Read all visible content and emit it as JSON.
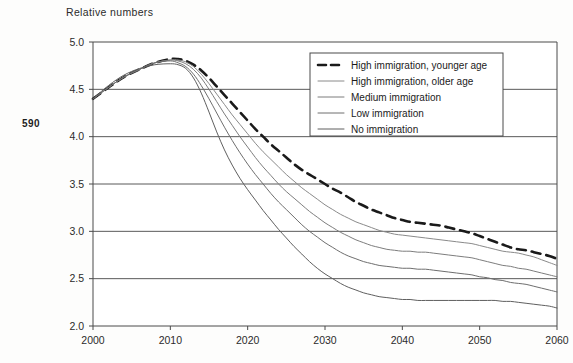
{
  "page": {
    "number": "590",
    "title": "Relative numbers"
  },
  "chart_data": {
    "type": "line",
    "title": "Relative numbers",
    "xlabel": "",
    "ylabel": "Relative numbers",
    "xlim": [
      2000,
      2060
    ],
    "ylim": [
      2.0,
      5.0
    ],
    "grid": true,
    "legend_position": "top-right",
    "x_ticks": [
      "2000",
      "2010",
      "2020",
      "2030",
      "2040",
      "2050",
      "2060"
    ],
    "y_ticks": [
      "5.0",
      "4.5",
      "4.0",
      "3.5",
      "3.0",
      "2.5",
      "2.0"
    ],
    "x": [
      2000,
      2002,
      2004,
      2006,
      2008,
      2010,
      2011,
      2012,
      2013,
      2014,
      2015,
      2016,
      2017,
      2018,
      2019,
      2020,
      2021,
      2022,
      2023,
      2024,
      2025,
      2026,
      2027,
      2028,
      2029,
      2030,
      2031,
      2032,
      2033,
      2034,
      2035,
      2036,
      2037,
      2038,
      2039,
      2040,
      2041,
      2042,
      2043,
      2044,
      2045,
      2046,
      2047,
      2048,
      2049,
      2050,
      2051,
      2052,
      2053,
      2054,
      2055,
      2056,
      2057,
      2058,
      2059,
      2060
    ],
    "series": [
      {
        "name": "High immigration, younger age",
        "style": "dashed",
        "color": "#1a1a1a",
        "width": 2.6,
        "values": [
          4.4,
          4.52,
          4.63,
          4.71,
          4.78,
          4.82,
          4.82,
          4.8,
          4.76,
          4.7,
          4.62,
          4.53,
          4.44,
          4.35,
          4.26,
          4.17,
          4.08,
          4.0,
          3.92,
          3.85,
          3.78,
          3.71,
          3.65,
          3.6,
          3.55,
          3.5,
          3.45,
          3.41,
          3.36,
          3.31,
          3.27,
          3.23,
          3.2,
          3.17,
          3.14,
          3.12,
          3.1,
          3.09,
          3.08,
          3.07,
          3.06,
          3.04,
          3.02,
          3.0,
          2.98,
          2.95,
          2.92,
          2.89,
          2.86,
          2.83,
          2.81,
          2.8,
          2.78,
          2.76,
          2.74,
          2.71
        ]
      },
      {
        "name": "High immigration, older age",
        "style": "solid",
        "color": "#8a8a8a",
        "width": 1.0,
        "values": [
          4.4,
          4.52,
          4.63,
          4.71,
          4.78,
          4.81,
          4.81,
          4.79,
          4.74,
          4.66,
          4.56,
          4.45,
          4.34,
          4.23,
          4.13,
          4.03,
          3.93,
          3.84,
          3.76,
          3.68,
          3.6,
          3.53,
          3.46,
          3.4,
          3.34,
          3.28,
          3.23,
          3.18,
          3.14,
          3.1,
          3.07,
          3.04,
          3.01,
          2.99,
          2.97,
          2.96,
          2.95,
          2.94,
          2.93,
          2.92,
          2.91,
          2.9,
          2.89,
          2.88,
          2.87,
          2.85,
          2.83,
          2.81,
          2.79,
          2.78,
          2.77,
          2.75,
          2.73,
          2.7,
          2.67,
          2.64
        ]
      },
      {
        "name": "Medium immigration",
        "style": "solid",
        "color": "#7d7d7d",
        "width": 1.0,
        "values": [
          4.4,
          4.52,
          4.63,
          4.71,
          4.78,
          4.81,
          4.8,
          4.77,
          4.71,
          4.62,
          4.5,
          4.37,
          4.24,
          4.12,
          4.0,
          3.89,
          3.78,
          3.68,
          3.59,
          3.5,
          3.42,
          3.35,
          3.28,
          3.21,
          3.15,
          3.09,
          3.04,
          2.99,
          2.95,
          2.91,
          2.88,
          2.85,
          2.83,
          2.81,
          2.8,
          2.79,
          2.79,
          2.78,
          2.78,
          2.77,
          2.76,
          2.75,
          2.74,
          2.73,
          2.72,
          2.7,
          2.68,
          2.66,
          2.64,
          2.63,
          2.61,
          2.6,
          2.58,
          2.56,
          2.54,
          2.52
        ]
      },
      {
        "name": "Low immigration",
        "style": "solid",
        "color": "#6e6e6e",
        "width": 1.0,
        "values": [
          4.4,
          4.52,
          4.63,
          4.71,
          4.78,
          4.8,
          4.78,
          4.74,
          4.66,
          4.54,
          4.4,
          4.25,
          4.1,
          3.96,
          3.83,
          3.71,
          3.6,
          3.5,
          3.4,
          3.31,
          3.23,
          3.15,
          3.07,
          3.0,
          2.94,
          2.88,
          2.83,
          2.78,
          2.74,
          2.71,
          2.68,
          2.66,
          2.64,
          2.63,
          2.62,
          2.61,
          2.61,
          2.6,
          2.6,
          2.59,
          2.58,
          2.57,
          2.56,
          2.55,
          2.54,
          2.52,
          2.51,
          2.49,
          2.48,
          2.46,
          2.45,
          2.44,
          2.42,
          2.4,
          2.38,
          2.36
        ]
      },
      {
        "name": "No immigration",
        "style": "solid",
        "color": "#5f5f5f",
        "width": 1.0,
        "values": [
          4.4,
          4.54,
          4.65,
          4.72,
          4.76,
          4.77,
          4.76,
          4.72,
          4.62,
          4.46,
          4.26,
          4.05,
          3.86,
          3.7,
          3.56,
          3.44,
          3.33,
          3.22,
          3.12,
          3.02,
          2.93,
          2.84,
          2.76,
          2.68,
          2.61,
          2.55,
          2.5,
          2.45,
          2.41,
          2.38,
          2.35,
          2.33,
          2.31,
          2.3,
          2.29,
          2.28,
          2.28,
          2.27,
          2.27,
          2.27,
          2.27,
          2.27,
          2.27,
          2.27,
          2.27,
          2.27,
          2.27,
          2.27,
          2.26,
          2.26,
          2.25,
          2.24,
          2.23,
          2.22,
          2.21,
          2.19
        ]
      }
    ]
  }
}
